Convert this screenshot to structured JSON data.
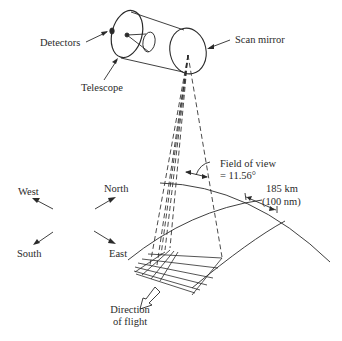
{
  "labels": {
    "detectors": "Detectors",
    "telescope": "Telescope",
    "scan_mirror": "Scan mirror",
    "fov_line1": "Field of view",
    "fov_line2": "= 11.56°",
    "swath_line1": "185 km",
    "swath_line2": "(100 nm)",
    "west": "West",
    "north": "North",
    "south": "South",
    "east": "East",
    "direction_line1": "Direction",
    "direction_line2": "of flight"
  },
  "colors": {
    "ink": "#2a2a2a",
    "background": "#ffffff"
  }
}
